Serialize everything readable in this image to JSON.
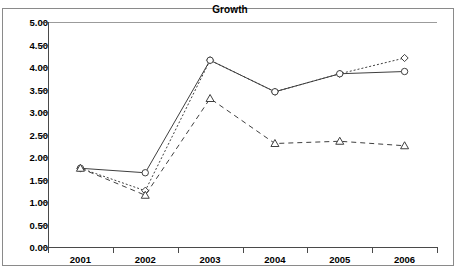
{
  "chart_data": {
    "type": "line",
    "title": "Growth",
    "xlabel": "",
    "ylabel": "",
    "categories": [
      "2001",
      "2002",
      "2003",
      "2004",
      "2005",
      "2006"
    ],
    "x_tick_labels": [
      "2001",
      "2002",
      "2003",
      "2004",
      "2005",
      "2006"
    ],
    "y_tick_labels": [
      "0.00",
      "0.50",
      "1.00",
      "1.50",
      "2.00",
      "2.50",
      "3.00",
      "3.50",
      "4.00",
      "4.50",
      "5.00"
    ],
    "y_tick_values": [
      0.0,
      0.5,
      1.0,
      1.5,
      2.0,
      2.5,
      3.0,
      3.5,
      4.0,
      4.5,
      5.0
    ],
    "ylim": [
      0.0,
      5.0
    ],
    "grid": false,
    "legend": "none",
    "series": [
      {
        "name": "series-1",
        "marker": "diamond",
        "line_style": "dotted",
        "values": [
          1.75,
          1.25,
          4.15,
          3.45,
          3.85,
          4.2
        ]
      },
      {
        "name": "series-2",
        "marker": "circle",
        "line_style": "solid",
        "values": [
          1.75,
          1.65,
          4.15,
          3.45,
          3.85,
          3.9
        ]
      },
      {
        "name": "series-3",
        "marker": "triangle",
        "line_style": "dashed",
        "values": [
          1.75,
          1.15,
          3.3,
          2.3,
          2.35,
          2.25
        ]
      }
    ]
  },
  "colors": {
    "background": "#ffffff",
    "line": "#3f3f3f",
    "axis": "#4a4a4a",
    "frame": "#8a8a8a",
    "text": "#000000"
  }
}
